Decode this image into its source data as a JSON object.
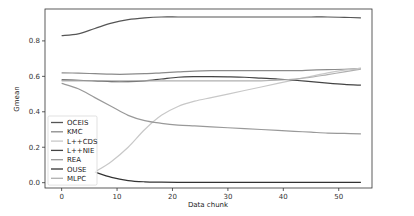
{
  "chart_data": {
    "type": "line",
    "title": "",
    "xlabel": "Data chunk",
    "ylabel": "Gmean",
    "xlim": [
      -3,
      56
    ],
    "ylim": [
      -0.03,
      0.98
    ],
    "xticks": [
      0,
      10,
      20,
      30,
      40,
      50
    ],
    "yticks": [
      0.0,
      0.2,
      0.4,
      0.6,
      0.8
    ],
    "xtick_labels": [
      "0",
      "10",
      "20",
      "30",
      "40",
      "50"
    ],
    "ytick_labels": [
      "0.0",
      "0.2",
      "0.4",
      "0.6",
      "0.8"
    ],
    "grid": false,
    "legend_position": "lower left",
    "x": [
      0,
      3,
      6,
      9,
      12,
      15,
      18,
      21,
      24,
      27,
      30,
      33,
      36,
      39,
      42,
      45,
      48,
      51,
      54
    ],
    "series": [
      {
        "name": "OCEIS",
        "color": "#555555",
        "values": [
          0.83,
          0.84,
          0.87,
          0.9,
          0.92,
          0.93,
          0.935,
          0.935,
          0.935,
          0.935,
          0.935,
          0.935,
          0.935,
          0.935,
          0.935,
          0.935,
          0.935,
          0.933,
          0.93
        ]
      },
      {
        "name": "KMC",
        "color": "#8a8a8a",
        "values": [
          0.62,
          0.618,
          0.615,
          0.612,
          0.612,
          0.615,
          0.62,
          0.625,
          0.63,
          0.632,
          0.632,
          0.632,
          0.632,
          0.632,
          0.632,
          0.635,
          0.638,
          0.64,
          0.645
        ]
      },
      {
        "name": "L++CDS",
        "color": "#c8c8c8",
        "values": [
          null,
          null,
          0.06,
          0.12,
          0.2,
          0.3,
          0.38,
          0.43,
          0.46,
          0.48,
          0.5,
          0.52,
          0.54,
          0.56,
          0.58,
          0.6,
          0.62,
          0.635,
          0.645
        ]
      },
      {
        "name": "L++NIE",
        "color": "#444444",
        "values": [
          0.58,
          0.578,
          0.575,
          0.57,
          0.57,
          0.575,
          0.585,
          0.595,
          0.598,
          0.598,
          0.597,
          0.595,
          0.59,
          0.585,
          0.578,
          0.57,
          0.562,
          0.555,
          0.55
        ]
      },
      {
        "name": "REA",
        "color": "#999999",
        "values": [
          0.56,
          0.53,
          0.48,
          0.43,
          0.38,
          0.35,
          0.335,
          0.325,
          0.32,
          0.315,
          0.31,
          0.305,
          0.3,
          0.295,
          0.29,
          0.285,
          0.28,
          0.278,
          0.275
        ]
      },
      {
        "name": "OUSE",
        "color": "#333333",
        "values": [
          null,
          null,
          0.06,
          0.03,
          0.012,
          0.005,
          0.003,
          0.002,
          0.002,
          0.002,
          0.002,
          0.002,
          0.002,
          0.002,
          0.002,
          0.002,
          0.002,
          0.002,
          0.002
        ]
      },
      {
        "name": "MLPC",
        "color": "#b0b0b0",
        "values": [
          0.575,
          0.575,
          0.575,
          0.575,
          0.575,
          0.575,
          0.575,
          0.575,
          0.575,
          0.575,
          0.575,
          0.575,
          0.575,
          0.578,
          0.585,
          0.595,
          0.61,
          0.625,
          0.64
        ]
      }
    ]
  }
}
